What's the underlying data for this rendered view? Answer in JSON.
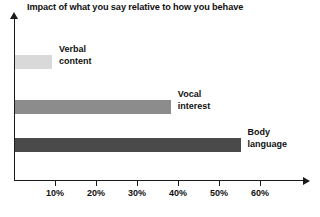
{
  "chart_data": {
    "type": "bar",
    "orientation": "horizontal",
    "title": "Impact of what you say relative to how you behave",
    "xlabel": "",
    "ylabel": "",
    "categories": [
      "Verbal content",
      "Vocal interest",
      "Body language"
    ],
    "values": [
      9,
      38,
      55
    ],
    "series": [
      {
        "name": "Impact",
        "values": [
          9,
          38,
          55
        ]
      }
    ],
    "bars": [
      {
        "label_line1": "Verbal",
        "label_line2": "content",
        "value": 9,
        "color": "#d9d9d9"
      },
      {
        "label_line1": "Vocal",
        "label_line2": "interest",
        "value": 38,
        "color": "#8c8c8c"
      },
      {
        "label_line1": "Body",
        "label_line2": "language",
        "value": 55,
        "color": "#4a4a4a"
      }
    ],
    "xlim": [
      0,
      70
    ],
    "xticks": [
      10,
      20,
      30,
      40,
      50,
      60
    ],
    "xtick_labels": [
      "10%",
      "20%",
      "30%",
      "40%",
      "50%",
      "60%"
    ],
    "grid": false,
    "legend": "none"
  }
}
